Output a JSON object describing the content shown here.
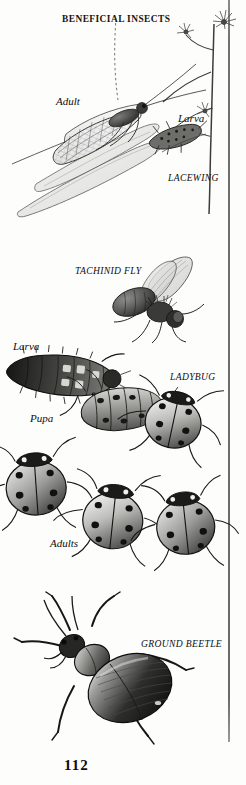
{
  "page": {
    "title": "BENEFICIAL INSECTS",
    "number": "112",
    "medium": "pen-and-ink scientific illustration plate",
    "background_color": "#fdfdfc",
    "ink_color": "#100d0b",
    "rule_color": "#707070"
  },
  "sections": [
    {
      "id": "lacewing",
      "common_name": "LACEWING",
      "labels": {
        "adult": "Adult",
        "larva": "Larva"
      },
      "figure_names": [
        "lacewing-adult-figure",
        "lacewing-larva-figure",
        "plant-stem-figure"
      ]
    },
    {
      "id": "tachinid-fly",
      "common_name": "TACHINID FLY",
      "labels": {},
      "figure_names": [
        "tachinid-fly-figure"
      ]
    },
    {
      "id": "ladybug",
      "common_name": "LADYBUG",
      "labels": {
        "larva": "Larva",
        "pupa": "Pupa",
        "adults": "Adults"
      },
      "figure_names": [
        "ladybug-larva-figure",
        "ladybug-pupa-figure",
        "ladybug-adult-figure"
      ]
    },
    {
      "id": "ground-beetle",
      "common_name": "GROUND BEETLE",
      "labels": {},
      "figure_names": [
        "ground-beetle-figure"
      ]
    }
  ],
  "captions": {
    "title": "BENEFICIAL INSECTS",
    "lacewing_adult": "Adult",
    "lacewing_larva": "Larva",
    "lacewing_name": "LACEWING",
    "tachinid_name": "TACHINID FLY",
    "ladybug_larva": "Larva",
    "ladybug_pupa": "Pupa",
    "ladybug_name": "LADYBUG",
    "ladybug_adults": "Adults",
    "ground_beetle_name": "GROUND BEETLE",
    "page_number": "112"
  }
}
